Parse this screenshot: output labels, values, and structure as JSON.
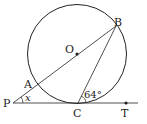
{
  "diagram": {
    "labels": {
      "O": "O",
      "A": "A",
      "B": "B",
      "P": "P",
      "C": "C",
      "T": "T",
      "angle_x": "x",
      "angle_64": "64°"
    }
  }
}
